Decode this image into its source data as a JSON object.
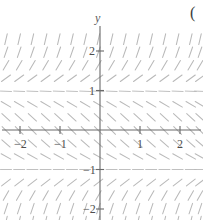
{
  "figure": {
    "partial_label": "(",
    "y_axis_label": "y"
  },
  "chart_data": {
    "type": "scatter",
    "subtype": "slope-field",
    "title": "",
    "xlabel": "",
    "ylabel": "y",
    "xlim": [
      -2.5,
      2.6
    ],
    "ylim": [
      -2.45,
      2.45
    ],
    "grid": false,
    "legend": null,
    "equation": "dy/dx = y^2 - 1",
    "x_ticks": [
      -2,
      -1,
      1,
      2
    ],
    "x_tick_labels": [
      "−2",
      "−1",
      "1",
      "2"
    ],
    "y_ticks": [
      -2,
      -1,
      1,
      2
    ],
    "y_tick_labels": [
      "−2",
      "−1",
      "1",
      "2"
    ],
    "equilibria": [
      1,
      -1
    ],
    "segment_color": "#b9b9b9",
    "axis_color": "#6a6a6a",
    "sample_x": [
      -2.35,
      -2.02,
      -1.69,
      -1.36,
      -1.03,
      -0.7,
      -0.37,
      -0.04,
      0.29,
      0.62,
      0.95,
      1.28,
      1.61,
      1.94,
      2.27,
      2.5
    ],
    "sample_y": [
      2.3,
      1.97,
      1.64,
      1.31,
      0.98,
      0.65,
      0.32,
      -0.01,
      -0.34,
      -0.67,
      -1.0,
      -1.33,
      -1.66,
      -1.99,
      -2.32
    ],
    "slopes_by_y": [
      {
        "y": 2.3,
        "slope": 4.29
      },
      {
        "y": 1.97,
        "slope": 2.88
      },
      {
        "y": 1.64,
        "slope": 1.69
      },
      {
        "y": 1.31,
        "slope": 0.72
      },
      {
        "y": 0.98,
        "slope": -0.04
      },
      {
        "y": 0.65,
        "slope": -0.58
      },
      {
        "y": 0.32,
        "slope": -0.9
      },
      {
        "y": -0.01,
        "slope": -1.0
      },
      {
        "y": -0.34,
        "slope": -0.88
      },
      {
        "y": -0.67,
        "slope": -0.55
      },
      {
        "y": -1.0,
        "slope": 0.0
      },
      {
        "y": -1.33,
        "slope": 0.77
      },
      {
        "y": -1.66,
        "slope": 1.76
      },
      {
        "y": -1.99,
        "slope": 2.96
      },
      {
        "y": -2.32,
        "slope": 4.38
      }
    ]
  },
  "geometry": {
    "origin_px": [
      100,
      130
    ],
    "unit_px_x": 40,
    "unit_px_y": 39.5,
    "segment_length_px": 11,
    "col_count": 16,
    "row_count": 15
  }
}
